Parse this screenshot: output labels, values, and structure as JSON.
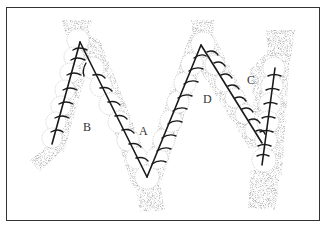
{
  "figure": {
    "type": "stippled line illustration",
    "labels": [
      {
        "id": "A",
        "text": "A",
        "x": 139,
        "y": 125
      },
      {
        "id": "B",
        "text": "B",
        "x": 83,
        "y": 121
      },
      {
        "id": "C",
        "text": "C",
        "x": 247,
        "y": 74
      },
      {
        "id": "D",
        "text": "D",
        "x": 203,
        "y": 93
      }
    ],
    "colors": {
      "line": "#1a1a1a",
      "stipple": "#777777",
      "frame": "#333333",
      "background": "#ffffff"
    }
  }
}
